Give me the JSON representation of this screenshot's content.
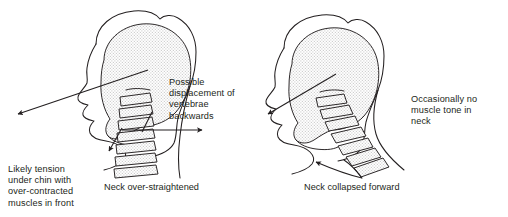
{
  "diagram": {
    "background_color": "#ffffff",
    "ink_color": "#231f20",
    "skull_fill_color": "#e8e8e8",
    "figures": [
      {
        "id": "left",
        "caption": "Neck over-straightened",
        "annotations": [
          "Possible\ndisplacement of\nvertebrae\nbackwards",
          "Likely tension\nunder chin with\nover-contracted\nmuscles in front"
        ],
        "vertebrae_count": 7,
        "vertebrae_orientation": "vertical"
      },
      {
        "id": "right",
        "caption": "Neck collapsed forward",
        "annotations": [
          "Occasionally no\nmuscle tone in\nneck"
        ],
        "vertebrae_count": 7,
        "vertebrae_orientation": "diagonal-forward"
      }
    ]
  },
  "notes": {
    "displacement": "Possible\ndisplacement of\nvertebrae\nbackwards",
    "tension": "Likely tension\nunder chin with\nover-contracted\nmuscles in front",
    "muscle_tone": "Occasionally no\nmuscle tone in\nneck"
  },
  "captions": {
    "left": "Neck over-straightened",
    "right": "Neck collapsed forward"
  }
}
